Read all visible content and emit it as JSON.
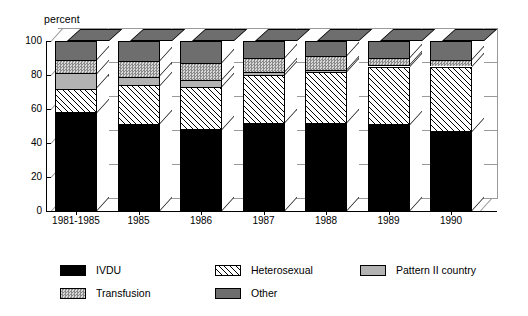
{
  "chart_data": {
    "type": "bar",
    "subtype": "stacked-3d-column",
    "title": "",
    "xlabel": "",
    "ylabel": "percent",
    "ylim": [
      0,
      100
    ],
    "yticks": [
      0,
      20,
      40,
      60,
      80,
      100
    ],
    "grid": true,
    "legend_position": "bottom",
    "categories": [
      "1981-1985",
      "1985",
      "1986",
      "1987",
      "1988",
      "1989",
      "1990"
    ],
    "series": [
      {
        "name": "IVDU",
        "values": [
          58,
          51,
          48,
          52,
          52,
          51,
          47
        ]
      },
      {
        "name": "Heterosexual",
        "values": [
          14,
          23,
          25,
          28,
          30,
          34,
          38
        ]
      },
      {
        "name": "Pattern II country",
        "values": [
          9,
          5,
          4,
          2,
          1,
          1,
          0
        ]
      },
      {
        "name": "Transfusion",
        "values": [
          8,
          9,
          10,
          8,
          8,
          4,
          4
        ]
      },
      {
        "name": "Other",
        "values": [
          11,
          12,
          13,
          10,
          9,
          10,
          11
        ]
      }
    ],
    "colors": {
      "IVDU": "#000000",
      "Heterosexual": "#ffffff",
      "Pattern II country": "#b3b3b3",
      "Transfusion": "#9a9a9a",
      "Other": "#6e6e6e",
      "gridline": "#9a9a9a",
      "axis": "#000000",
      "background": "#ffffff"
    }
  },
  "axis": {
    "ylabel": "percent",
    "ytick_labels": [
      "100",
      "80",
      "60",
      "40",
      "20",
      "0"
    ],
    "xtick_labels": [
      "1981-1985",
      "1985",
      "1986",
      "1987",
      "1988",
      "1989",
      "1990"
    ]
  },
  "legend": {
    "items": [
      {
        "label": "IVDU",
        "swatch": "solid-black-swatch"
      },
      {
        "label": "Heterosexual",
        "swatch": "diagonal-hatch-swatch"
      },
      {
        "label": "Pattern II country",
        "swatch": "light-gray-swatch"
      },
      {
        "label": "Transfusion",
        "swatch": "stipple-gray-swatch"
      },
      {
        "label": "Other",
        "swatch": "dark-gray-swatch"
      }
    ]
  },
  "caption": {
    "text": ""
  }
}
